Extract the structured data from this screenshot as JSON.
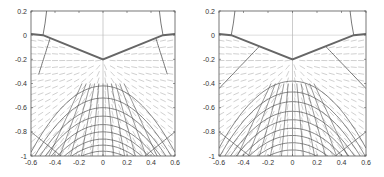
{
  "chart_data": [
    {
      "type": "line",
      "panel": "left",
      "title": "",
      "xlabel": "",
      "ylabel": "",
      "xlim": [
        -0.6,
        0.6
      ],
      "ylim": [
        -1,
        0.2
      ],
      "xticks": [
        "-0.6",
        "-0.4",
        "-0.2",
        "0",
        "0.2",
        "0.4",
        "0.6"
      ],
      "yticks": [
        "0.2",
        "0",
        "-0.2",
        "-0.4",
        "-0.6",
        "-0.8",
        "-1"
      ],
      "description": "Vector field with contour/streamline grid below a V-shaped boundary",
      "boundary": {
        "x": [
          -0.6,
          -0.5,
          0,
          0.5,
          0.6
        ],
        "y": [
          0.01,
          0,
          -0.2,
          0,
          0.01
        ]
      },
      "arcs_apex_y": [
        -0.42,
        -0.52,
        -0.6,
        -0.67,
        -0.74,
        -0.8,
        -0.86,
        -0.91,
        -0.96
      ],
      "separatrix_top_x": [
        -0.44,
        0.44
      ]
    },
    {
      "type": "line",
      "panel": "right",
      "title": "",
      "xlabel": "",
      "ylabel": "",
      "xlim": [
        -0.6,
        0.6
      ],
      "ylim": [
        -1,
        0.2
      ],
      "xticks": [
        "-0.6",
        "-0.4",
        "-0.2",
        "0",
        "0.2",
        "0.4",
        "0.6"
      ],
      "yticks": [
        "0.2",
        "0",
        "-0.2",
        "-0.4",
        "-0.6",
        "-0.8",
        "-1"
      ],
      "description": "Vector field with contour/streamline grid below a V-shaped boundary",
      "boundary": {
        "x": [
          -0.6,
          -0.5,
          0,
          0.5,
          0.6
        ],
        "y": [
          0.01,
          0,
          -0.2,
          0,
          0.01
        ]
      },
      "arcs_apex_y": [
        -0.38,
        -0.47,
        -0.55,
        -0.63,
        -0.7,
        -0.77,
        -0.83,
        -0.89,
        -0.95
      ],
      "separatrix_top_x": [
        -0.27,
        0.27
      ]
    }
  ],
  "panels": [
    {
      "id": "left"
    },
    {
      "id": "right"
    }
  ]
}
